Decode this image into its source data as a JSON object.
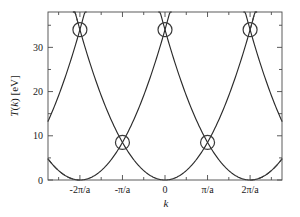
{
  "chart_data": {
    "type": "line",
    "title": "",
    "xlabel": "k",
    "ylabel": "T(k) [eV]",
    "ylabel_parts": {
      "t": "T",
      "open": "(",
      "k": "k",
      "close": ")",
      "unit": " [eV]"
    },
    "xlim": [
      -2.75,
      2.75
    ],
    "ylim": [
      0,
      38
    ],
    "x_unit": "pi/a",
    "grid": false,
    "legend": null,
    "x_ticks": [
      {
        "value": -2,
        "label": "-2π/a"
      },
      {
        "value": -1,
        "label": "-π/a"
      },
      {
        "value": 0,
        "label": "0"
      },
      {
        "value": 1,
        "label": "π/a"
      },
      {
        "value": 2,
        "label": "2π/a"
      }
    ],
    "x_minor_ticks": [
      -2.5,
      -1.5,
      -0.5,
      0.5,
      1.5,
      2.5
    ],
    "y_ticks": [
      {
        "value": 0,
        "label": "0"
      },
      {
        "value": 10,
        "label": "10"
      },
      {
        "value": 20,
        "label": "20"
      },
      {
        "value": 30,
        "label": "30"
      }
    ],
    "y_minor_ticks": [
      5,
      15,
      25,
      35
    ],
    "series": [
      {
        "name": "free-electron parabola (reduced zone, centered 0)",
        "style": "solid",
        "center": 0,
        "curvature": 8.5,
        "comment": "T = 8.5*(k/(pi/a))^2 eV"
      },
      {
        "name": "free-electron parabola (shifted by -2pi/a)",
        "style": "solid",
        "center": -2,
        "curvature": 8.5
      },
      {
        "name": "free-electron parabola (shifted by +2pi/a)",
        "style": "solid",
        "center": 2,
        "curvature": 8.5
      },
      {
        "name": "free-electron parabola (shifted by -4pi/a)",
        "style": "solid",
        "center": -4,
        "curvature": 8.5
      },
      {
        "name": "free-electron parabola (shifted by +4pi/a)",
        "style": "solid",
        "center": 4,
        "curvature": 8.5
      },
      {
        "name": "extended parabola branch (dashed, left)",
        "style": "dashed",
        "center": 0,
        "curvature": 8.5,
        "range": [
          -2.75,
          -2.0
        ]
      },
      {
        "name": "extended parabola branch (dashed, right)",
        "style": "dashed",
        "center": 0,
        "curvature": 8.5,
        "range": [
          2.0,
          2.75
        ]
      },
      {
        "name": "extended parabola branch (dashed, inner left)",
        "style": "dashed",
        "center": -2,
        "curvature": 8.5,
        "range": [
          -2.75,
          -2.0
        ]
      },
      {
        "name": "extended parabola branch (dashed, inner right)",
        "style": "dashed",
        "center": 2,
        "curvature": 8.5,
        "range": [
          2.0,
          2.75
        ]
      }
    ],
    "markers": [
      {
        "label": "degeneracy point",
        "x": -2,
        "y": 34
      },
      {
        "label": "degeneracy point",
        "x": -1,
        "y": 8.5
      },
      {
        "label": "degeneracy point",
        "x": 0,
        "y": 34
      },
      {
        "label": "degeneracy point",
        "x": 1,
        "y": 8.5
      },
      {
        "label": "degeneracy point",
        "x": 2,
        "y": 34
      }
    ],
    "marker_style": {
      "shape": "circle-with-cross",
      "radius_px": 7
    },
    "colors": {
      "curve": "#2b2b2b",
      "dashed": "#3a3a3a",
      "axis": "#4a4a4a",
      "marker": "#3a3a3a",
      "background": "#ffffff"
    }
  }
}
